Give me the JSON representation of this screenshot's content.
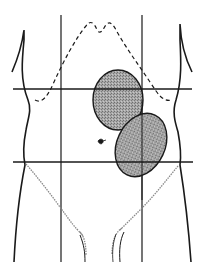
{
  "diagram": {
    "colors": {
      "background": "#ffffff",
      "line": "#1a1a1a",
      "mass_fill": "#9a9a9a",
      "hair": "#888888"
    },
    "grid": {
      "vertical_lines_x": [
        61,
        142
      ],
      "horizontal_lines_y": [
        89,
        162
      ]
    },
    "masses": [
      {
        "name": "upper-mass",
        "cx": 118,
        "cy": 100,
        "rx": 25,
        "ry": 30,
        "rotate": 0
      },
      {
        "name": "lower-mass",
        "cx": 141,
        "cy": 145,
        "rx": 24,
        "ry": 33,
        "rotate": 25
      }
    ],
    "caption": ""
  }
}
